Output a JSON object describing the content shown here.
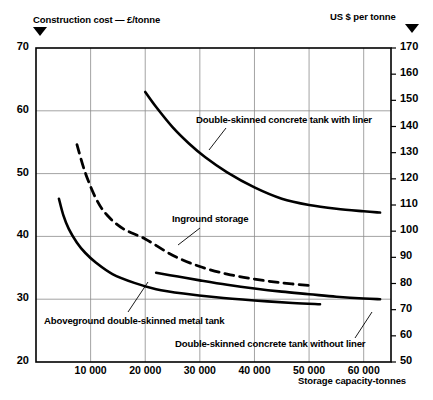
{
  "chart_data": {
    "type": "line",
    "title": "",
    "xlabel": "Storage capacity-tonnes",
    "ylabel_left": "Construction cost — £/tonne",
    "ylabel_right": "US $ per tonne",
    "xlim": [
      0,
      65000
    ],
    "ylim_left": [
      20,
      70
    ],
    "ylim_right": [
      50,
      170
    ],
    "grid": true,
    "legend": "inline-annotations",
    "xticks": [
      10000,
      20000,
      30000,
      40000,
      50000,
      60000
    ],
    "xtick_labels": [
      "10 000",
      "20 000",
      "30 000",
      "40 000",
      "50 000",
      "60 000"
    ],
    "yticks_left": [
      20,
      30,
      40,
      50,
      60,
      70
    ],
    "ytick_labels_left": [
      "20",
      "30",
      "40",
      "50",
      "60",
      "70"
    ],
    "yticks_right": [
      50,
      60,
      70,
      80,
      90,
      100,
      110,
      120,
      130,
      140,
      150,
      160,
      170
    ],
    "ytick_labels_right": [
      "50",
      "60",
      "70",
      "80",
      "90",
      "100",
      "110",
      "120",
      "130",
      "140",
      "150",
      "160",
      "170"
    ],
    "series": [
      {
        "name": "Double-skinned concrete tank with liner",
        "style": "solid",
        "x": [
          20000,
          22000,
          25000,
          28000,
          31000,
          35000,
          40000,
          45000,
          50000,
          55000,
          60000,
          63000
        ],
        "values": [
          63.0,
          60.6,
          57.4,
          54.8,
          52.6,
          50.2,
          47.8,
          46.0,
          45.0,
          44.4,
          44.0,
          43.8
        ]
      },
      {
        "name": "Inground storage",
        "style": "dashed",
        "x": [
          7500,
          9000,
          11000,
          13000,
          16000,
          20000,
          25000,
          30000,
          35000,
          40000,
          45000,
          50000
        ],
        "values": [
          54.6,
          50.2,
          46.0,
          43.4,
          41.2,
          39.6,
          37.0,
          35.2,
          34.0,
          33.2,
          32.6,
          32.2
        ]
      },
      {
        "name": "Aboveground double-skinned metal tank",
        "style": "solid",
        "x": [
          4200,
          5000,
          6000,
          7500,
          9000,
          11000,
          14000,
          18000,
          22000,
          27000,
          33000,
          40000,
          47000,
          52000
        ],
        "values": [
          46.0,
          43.4,
          41.2,
          39.0,
          37.4,
          35.8,
          34.0,
          32.6,
          31.6,
          30.9,
          30.3,
          29.8,
          29.4,
          29.2
        ]
      },
      {
        "name": "Double-skinned concrete tank without liner",
        "style": "solid",
        "x": [
          22000,
          26000,
          30000,
          35000,
          40000,
          45000,
          50000,
          55000,
          60000,
          63000
        ],
        "values": [
          34.2,
          33.6,
          33.0,
          32.3,
          31.7,
          31.2,
          30.8,
          30.4,
          30.1,
          30.0
        ]
      }
    ],
    "annotations": [
      {
        "text": "Double-skinned concrete tank with liner",
        "id": "ann-liner"
      },
      {
        "text": "Inground storage",
        "id": "ann-inground"
      },
      {
        "text": "Aboveground double-skinned metal tank",
        "id": "ann-metal"
      },
      {
        "text": "Double-skinned concrete tank without liner",
        "id": "ann-noliner"
      }
    ],
    "colors": {
      "line": "#000000",
      "grid": "#8c8c8c",
      "frame": "#000000",
      "background": "#ffffff"
    }
  }
}
